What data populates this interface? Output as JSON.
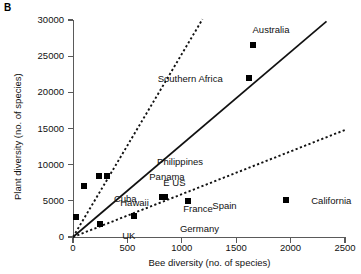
{
  "panel": {
    "label": "B"
  },
  "chart_data": {
    "type": "scatter",
    "title": "",
    "xlabel": "Bee diversity (no. of species)",
    "ylabel": "Plant diversity (no. of species)",
    "xlim": [
      0,
      2500
    ],
    "ylim": [
      0,
      30000
    ],
    "xticks": [
      0,
      500,
      1000,
      1500,
      2000,
      2500
    ],
    "xtick_labels": [
      "0",
      "500",
      "1000",
      "1500",
      "2000",
      "2500"
    ],
    "yticks": [
      0,
      5000,
      10000,
      15000,
      20000,
      25000,
      30000
    ],
    "ytick_labels": [
      "0",
      "5000",
      "10000",
      "15000",
      "20000",
      "25000",
      "30000"
    ],
    "grid": false,
    "legend": "none",
    "marker_color": "#000000",
    "points": [
      {
        "label": "Hawaii",
        "x": 30,
        "y": 2800,
        "lx": 44,
        "ly": -14,
        "wide": false
      },
      {
        "label": "Cuba",
        "x": 100,
        "y": 7100,
        "lx": 30,
        "ly": 13,
        "wide": false
      },
      {
        "label": "UK",
        "x": 250,
        "y": 1800,
        "lx": 22,
        "ly": 12,
        "wide": false
      },
      {
        "label": "Philippines",
        "x": 240,
        "y": 8500,
        "lx": 58,
        "ly": -14,
        "wide": false
      },
      {
        "label": "Panama",
        "x": 315,
        "y": 8500,
        "lx": 42,
        "ly": 1,
        "wide": false
      },
      {
        "label": "Germany",
        "x": 560,
        "y": 2900,
        "lx": 46,
        "ly": 13,
        "wide": false
      },
      {
        "label": "E US",
        "x": 830,
        "y": 5500,
        "lx": 0,
        "ly": -14,
        "wide": true
      },
      {
        "label": "France",
        "x": 830,
        "y": 5500,
        "lx": 20,
        "ly": 12,
        "wide": true
      },
      {
        "label": "Spain",
        "x": 1060,
        "y": 5000,
        "lx": 24,
        "ly": 5,
        "wide": false
      },
      {
        "label": "California",
        "x": 1960,
        "y": 5100,
        "lx": 25,
        "ly": 1,
        "wide": false
      },
      {
        "label": "Southern Africa",
        "x": 1615,
        "y": 22000,
        "lx": -91,
        "ly": 1,
        "wide": false
      },
      {
        "label": "Australia",
        "x": 1650,
        "y": 26500,
        "lx": 0,
        "ly": -15,
        "wide": false
      }
    ],
    "trend_lines": [
      {
        "name": "upper-dashed-line",
        "style": "dashed",
        "x0": 0,
        "y0": 0,
        "x1": 1190,
        "y1": 30100
      },
      {
        "name": "solid-line",
        "style": "solid",
        "x0": 0,
        "y0": 0,
        "x1": 2330,
        "y1": 29800
      },
      {
        "name": "lower-dashed-line",
        "style": "dashed",
        "x0": 0,
        "y0": 0,
        "x1": 2500,
        "y1": 14800
      }
    ]
  }
}
